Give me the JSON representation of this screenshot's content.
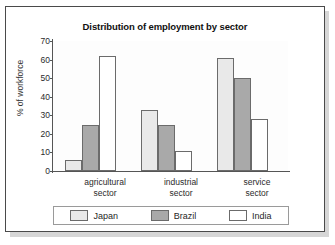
{
  "chart_data": {
    "type": "bar",
    "title": "Distribution of employment by sector",
    "xlabel": "",
    "ylabel": "% of workforce",
    "categories": [
      "agricultural sector",
      "industrial sector",
      "service sector"
    ],
    "category_lines": [
      [
        "agricultural",
        "sector"
      ],
      [
        "industrial",
        "sector"
      ],
      [
        "service",
        "sector"
      ]
    ],
    "series": [
      {
        "name": "Japan",
        "color": "#e9e9e9",
        "values": [
          6,
          33,
          61
        ]
      },
      {
        "name": "Brazil",
        "color": "#a9a9a9",
        "values": [
          25,
          25,
          50
        ]
      },
      {
        "name": "India",
        "color": "#ffffff",
        "values": [
          62,
          11,
          28
        ]
      }
    ],
    "ylim": [
      0,
      70
    ],
    "yticks": [
      0,
      10,
      20,
      30,
      40,
      50,
      60,
      70
    ],
    "ytick_labels": [
      "0",
      "10",
      "20",
      "30",
      "40",
      "50",
      "60",
      "70"
    ],
    "grid": false,
    "legend_position": "bottom",
    "legend_entries": [
      "Japan",
      "Brazil",
      "India"
    ]
  },
  "figure": {
    "border_color": "#4a4a4a",
    "background": "#ffffff",
    "axis_color": "#555555",
    "bar_outline": "#6b6b6b"
  }
}
